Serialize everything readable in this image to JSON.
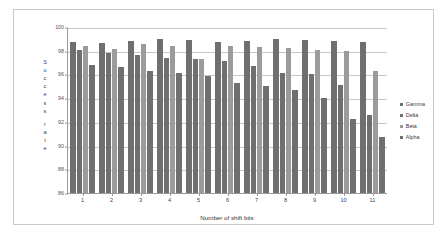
{
  "chart_data": {
    "type": "bar",
    "title": "",
    "xlabel": "Number of shift bits",
    "ylabel": "Success rate",
    "ylim": [
      86,
      100
    ],
    "ytick_step": 2,
    "yticks": [
      86,
      88,
      90,
      92,
      94,
      96,
      98,
      100
    ],
    "grid": true,
    "legend_position": "right",
    "categories": [
      "1",
      "2",
      "3",
      "4",
      "5",
      "6",
      "7",
      "8",
      "9",
      "10",
      "11"
    ],
    "series": [
      {
        "name": "Gamma",
        "color": "#6f6f6f",
        "values": [
          98.7,
          98.65,
          98.85,
          99.0,
          98.9,
          98.75,
          98.8,
          99.0,
          98.9,
          98.8,
          98.75
        ]
      },
      {
        "name": "Delta",
        "color": "#6f6f6f",
        "values": [
          98.1,
          97.85,
          97.6,
          97.4,
          97.3,
          97.1,
          96.75,
          96.1,
          96.0,
          95.15,
          92.55
        ]
      },
      {
        "name": "Beta",
        "color": "#9b9b9b",
        "values": [
          98.4,
          98.15,
          98.6,
          98.4,
          97.3,
          98.4,
          98.35,
          98.25,
          98.05,
          97.95,
          96.25
        ]
      },
      {
        "name": "Alpha",
        "color": "#6f6f6f",
        "values": [
          96.8,
          96.6,
          96.25,
          96.15,
          95.85,
          95.3,
          95.0,
          94.65,
          94.0,
          92.25,
          90.75
        ]
      }
    ]
  },
  "axes": {
    "y_title_letters": [
      "S",
      "u",
      "c",
      "c",
      "e",
      "s",
      "s",
      "r",
      "a",
      "t",
      "e"
    ],
    "y_title_break_after_index": 6
  },
  "legend": {
    "items": [
      {
        "label": "Gamma",
        "color": "#6f6f6f"
      },
      {
        "label": "Delta",
        "color": "#6f6f6f"
      },
      {
        "label": "Beta",
        "color": "#9b9b9b"
      },
      {
        "label": "Alpha",
        "color": "#6f6f6f"
      }
    ]
  }
}
